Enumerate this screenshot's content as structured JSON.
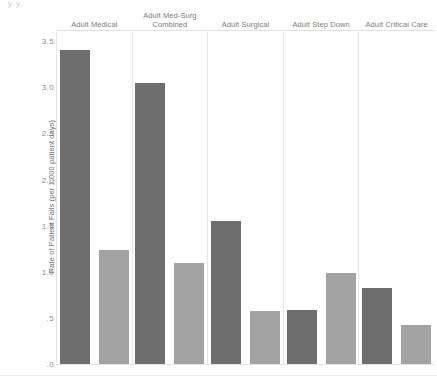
{
  "top_artifact": "y  y,",
  "chart_data": {
    "type": "bar",
    "title": "",
    "subtitle": "",
    "xlabel": "",
    "ylabel": "Rate of Patient Falls (per 1,000 patient days)",
    "ylim": [
      0,
      3.6
    ],
    "grid": false,
    "legend": "none",
    "orientation": "vertical",
    "panel_layout": "small-multiples",
    "categories": [
      "Adult Medical",
      "Adult Med-Surg Combined",
      "Adult Surgical",
      "Adult Step Down",
      "Adult Critical Care"
    ],
    "yticks": [
      ".0",
      ".5",
      "1.0",
      "1.5",
      "2.0",
      "2.5",
      "3.0",
      "3.5"
    ],
    "ytick_values": [
      0.0,
      0.5,
      1.0,
      1.5,
      2.0,
      2.5,
      3.0,
      3.5
    ],
    "series": [
      {
        "name": "Series 1",
        "color": "#6e6e6e",
        "values": [
          3.4,
          3.05,
          1.55,
          0.59,
          0.82
        ]
      },
      {
        "name": "Series 2",
        "color": "#a3a3a3",
        "values": [
          1.24,
          1.1,
          0.57,
          0.99,
          0.42
        ]
      }
    ]
  },
  "colors": {
    "dark_bar": "#6e6e6e",
    "light_bar": "#a3a3a3",
    "gridline": "#e6e6e6",
    "text": "#7d7d7d",
    "background": "#ffffff"
  }
}
